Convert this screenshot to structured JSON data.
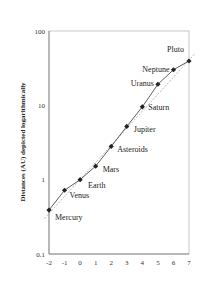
{
  "chart_data": {
    "type": "scatter",
    "title": "",
    "xlabel": "",
    "ylabel": "Distances (AU) depicted logarithmically",
    "yscale": "log",
    "xlim": [
      -2,
      7
    ],
    "ylim": [
      0.1,
      100
    ],
    "x_ticks": [
      "-2",
      "-1",
      "0",
      "1",
      "2",
      "3",
      "4",
      "5",
      "6",
      "7"
    ],
    "y_ticks": [
      "0.1",
      "1",
      "10",
      "100"
    ],
    "grid": false,
    "legend": null,
    "series": [
      {
        "name": "Planets",
        "style": "solid line with diamond markers",
        "points": [
          {
            "label": "Mercury",
            "x": -2,
            "y": 0.39
          },
          {
            "label": "Venus",
            "x": -1,
            "y": 0.72
          },
          {
            "label": "Earth",
            "x": 0,
            "y": 1.0
          },
          {
            "label": "Mars",
            "x": 1,
            "y": 1.52
          },
          {
            "label": "Asteroids",
            "x": 2,
            "y": 2.8
          },
          {
            "label": "Jupiter",
            "x": 3,
            "y": 5.2
          },
          {
            "label": "Saturn",
            "x": 4,
            "y": 9.54
          },
          {
            "label": "Uranus",
            "x": 5,
            "y": 19.2
          },
          {
            "label": "Neptune",
            "x": 6,
            "y": 30.1
          },
          {
            "label": "Pluto",
            "x": 7,
            "y": 39.5
          }
        ]
      },
      {
        "name": "Exponential fit",
        "style": "dashed trend line",
        "points": [
          {
            "x": -2.3,
            "y": 0.3
          },
          {
            "x": 7.4,
            "y": 50
          }
        ]
      }
    ]
  }
}
